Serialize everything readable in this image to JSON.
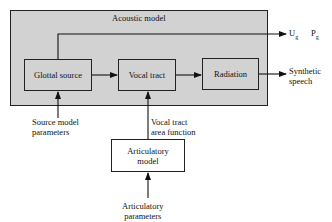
{
  "diagram": {
    "container_label": "Acoustic model",
    "blocks": [
      {
        "id": "glottal",
        "label": "Glottal source"
      },
      {
        "id": "vocal",
        "label": "Vocal tract"
      },
      {
        "id": "radiation",
        "label": "Radiation"
      },
      {
        "id": "articulatory",
        "label": "Articulatory\nmodel"
      }
    ],
    "inputs": {
      "source_params": "Source model\nparameters",
      "area_function": "Vocal tract\narea function",
      "articulatory_params": "Articulatory\nparameters"
    },
    "outputs": {
      "ug": "U",
      "ug_sub": "g",
      "pg": "P",
      "pg_sub": "g",
      "speech": "Synthetic\nspeech"
    },
    "edges": [
      {
        "from": "Glottal source",
        "to": "Vocal tract"
      },
      {
        "from": "Vocal tract",
        "to": "Radiation"
      },
      {
        "from": "Radiation",
        "to": "Synthetic speech"
      },
      {
        "from": "Glottal source",
        "to": "Ug Pg"
      },
      {
        "from": "Source model parameters",
        "to": "Glottal source"
      },
      {
        "from": "Articulatory model",
        "to": "Vocal tract",
        "label": "Vocal tract area function"
      },
      {
        "from": "Articulatory parameters",
        "to": "Articulatory model"
      }
    ]
  }
}
